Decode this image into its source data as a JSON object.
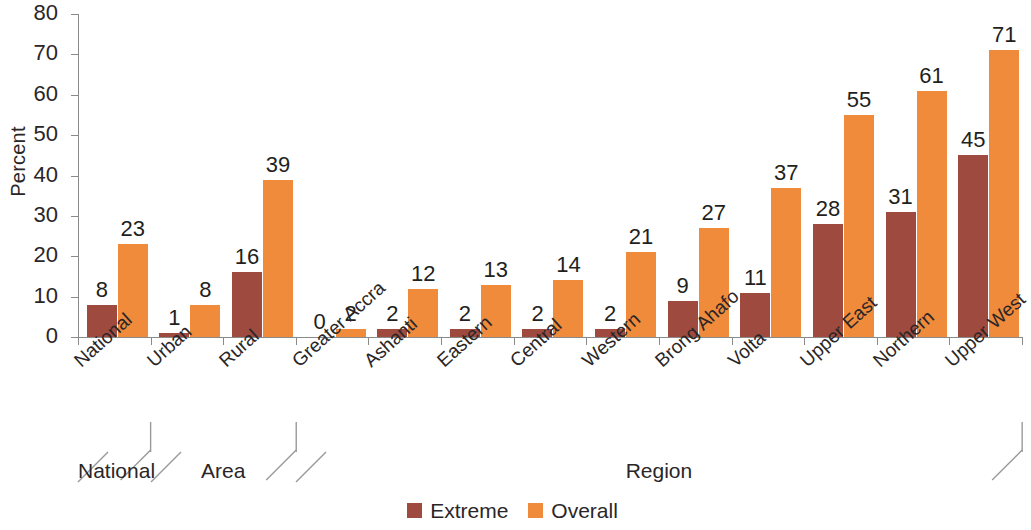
{
  "chart_data": {
    "type": "bar",
    "title": "",
    "xlabel": "Region",
    "ylabel": "Percent",
    "ylim": [
      0,
      80
    ],
    "ytick_step": 10,
    "yticks": [
      "80",
      "70",
      "60",
      "50",
      "40",
      "30",
      "20",
      "10",
      "0"
    ],
    "grid": false,
    "legend_position": "bottom-center",
    "categories": [
      "National",
      "Urban",
      "Rural",
      "Greater Accra",
      "Ashanti",
      "Eastern",
      "Central",
      "Western",
      "Brong Ahafo",
      "Volta",
      "Upper East",
      "Northern",
      "Upper West"
    ],
    "series": [
      {
        "name": "Extreme",
        "color": "#9e4a3e",
        "values": [
          8,
          1,
          16,
          0,
          2,
          2,
          2,
          2,
          9,
          11,
          28,
          31,
          45
        ]
      },
      {
        "name": "Overall",
        "color": "#f08b3c",
        "values": [
          23,
          8,
          39,
          2,
          12,
          13,
          14,
          21,
          27,
          37,
          55,
          61,
          71
        ]
      }
    ],
    "group_labels": [
      {
        "text": "National",
        "start_index": 0,
        "end_index": 0
      },
      {
        "text": "Area",
        "start_index": 1,
        "end_index": 2
      },
      {
        "text": "Region",
        "start_index": 3,
        "end_index": 12
      }
    ]
  },
  "legend": {
    "items": [
      {
        "label": "Extreme",
        "color": "#9e4a3e"
      },
      {
        "label": "Overall",
        "color": "#f08b3c"
      }
    ]
  }
}
